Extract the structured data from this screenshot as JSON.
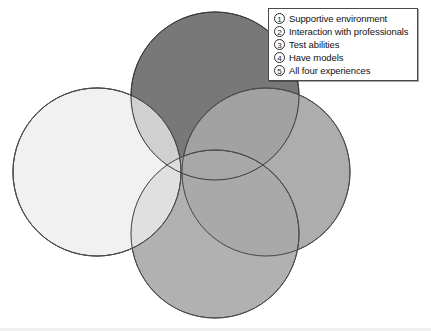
{
  "figure": {
    "background_color": "#ffffff"
  },
  "legend": {
    "border_color": "#4a4a4a",
    "background_color": "#ffffff",
    "items": [
      {
        "marker": "1",
        "label": "Supportive environment"
      },
      {
        "marker": "2",
        "label": "Interaction with professionals"
      },
      {
        "marker": "3",
        "label": "Test abilities"
      },
      {
        "marker": "4",
        "label": "Have models"
      },
      {
        "marker": "5",
        "label": "All four experiences"
      }
    ]
  },
  "chart_data": {
    "type": "diagram",
    "subtype": "venn-four-circle",
    "sets": [
      {
        "id": "1",
        "name": "Supportive environment",
        "position": "left",
        "cx": 97,
        "cy": 172,
        "r": 84,
        "fill": "#ededed",
        "stroke": "#4a4a4a"
      },
      {
        "id": "2",
        "name": "Interaction with professionals",
        "position": "top",
        "cx": 215,
        "cy": 96,
        "r": 84,
        "fill": "#787878",
        "stroke": "#3a3a3a"
      },
      {
        "id": "3",
        "name": "Test abilities",
        "position": "right",
        "cx": 266,
        "cy": 172,
        "r": 84,
        "fill": "#a6a6a6",
        "stroke": "#4a4a4a"
      },
      {
        "id": "4",
        "name": "Have models",
        "position": "bottom",
        "cx": 215,
        "cy": 234,
        "r": 84,
        "fill": "#a8a8a8",
        "stroke": "#4a4a4a"
      }
    ],
    "center_region": {
      "id": "5",
      "name": "All four experiences",
      "fill": "#e8e8e8"
    },
    "legend_position": "top-right",
    "grid": false
  }
}
